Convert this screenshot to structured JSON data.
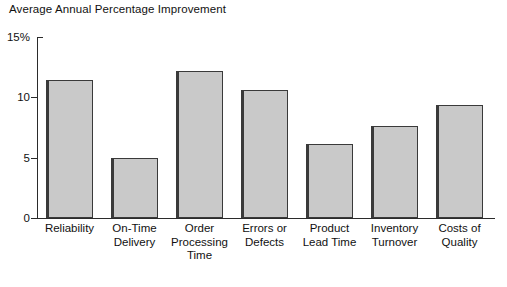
{
  "chart_data": {
    "type": "bar",
    "title": "Average Annual Percentage Improvement",
    "xlabel": "",
    "ylabel": "",
    "ylim": [
      0,
      15
    ],
    "yticks": [
      0,
      5,
      10,
      15
    ],
    "ytick_labels": [
      "0",
      "5",
      "10",
      "15%"
    ],
    "grid": false,
    "legend": null,
    "categories": [
      "Reliability",
      "On-Time Delivery",
      "Order Processing Time",
      "Errors or Defects",
      "Product Lead Time",
      "Inventory Turnover",
      "Costs of Quality"
    ],
    "category_label_lines": [
      "Reliability",
      "On-Time\nDelivery",
      "Order\nProcessing\nTime",
      "Errors or\nDefects",
      "Product\nLead Time",
      "Inventory\nTurnover",
      "Costs of\nQuality"
    ],
    "values": [
      11.4,
      5.0,
      12.2,
      10.6,
      6.1,
      7.6,
      9.4
    ],
    "bar_fill_color": "#c9c9c9",
    "bar_edge_color": "#3a3a3a",
    "axis_color": "#2b2b2b",
    "background_color": "#ffffff"
  }
}
